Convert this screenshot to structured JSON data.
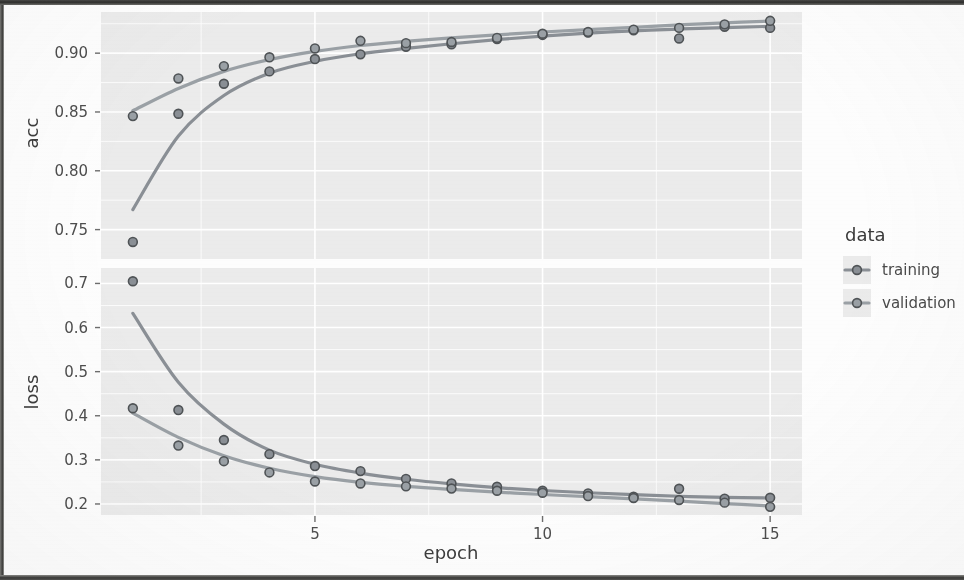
{
  "figure": {
    "background_color": "#fdfdfd",
    "panel_fill": "#ebebeb",
    "grid_color": "#ffffff",
    "training_color": "#8a8f95",
    "validation_color": "#9aa0a5",
    "point_stroke": "#4f5356"
  },
  "axes": {
    "x_title": "epoch",
    "x_ticks": [
      "5",
      "10",
      "15"
    ],
    "x_tick_values": [
      5,
      10,
      15
    ],
    "x_range": [
      0.3,
      15.7
    ],
    "panels": [
      {
        "name": "acc",
        "y_title": "acc",
        "y_ticks": [
          "0.90",
          "0.85",
          "0.80",
          "0.75"
        ],
        "y_tick_values": [
          0.9,
          0.85,
          0.8,
          0.75
        ],
        "y_range": [
          0.725,
          0.935
        ]
      },
      {
        "name": "loss",
        "y_title": "loss",
        "y_ticks": [
          "0.7",
          "0.6",
          "0.5",
          "0.4",
          "0.3",
          "0.2"
        ],
        "y_tick_values": [
          0.7,
          0.6,
          0.5,
          0.4,
          0.3,
          0.2
        ],
        "y_range": [
          0.175,
          0.735
        ]
      }
    ]
  },
  "legend": {
    "title": "data",
    "items": [
      {
        "label": "training",
        "color": "#8a8f95"
      },
      {
        "label": "validation",
        "color": "#9aa0a5"
      }
    ]
  },
  "chart_data": {
    "type": "line",
    "title": "",
    "subtitle": "",
    "xlabel": "epoch",
    "x": [
      1,
      2,
      3,
      4,
      5,
      6,
      7,
      8,
      9,
      10,
      11,
      12,
      13,
      14,
      15
    ],
    "grid": true,
    "legend_position": "right",
    "facets": [
      {
        "name": "acc",
        "ylabel": "acc",
        "ylim": [
          0.725,
          0.935
        ],
        "yticks": [
          0.75,
          0.8,
          0.85,
          0.9
        ],
        "series": [
          {
            "name": "training",
            "color": "#8a8f95",
            "values": [
              0.7395,
              0.8485,
              0.874,
              0.8845,
              0.895,
              0.899,
              0.9055,
              0.9075,
              0.912,
              0.9155,
              0.9175,
              0.9195,
              0.9125,
              0.9225,
              0.9215
            ],
            "smooth": [
              0.767,
              0.8295,
              0.864,
              0.883,
              0.893,
              0.8995,
              0.904,
              0.908,
              0.9115,
              0.9145,
              0.917,
              0.919,
              0.9205,
              0.9218,
              0.9228
            ]
          },
          {
            "name": "validation",
            "color": "#9aa0a5",
            "values": [
              0.8465,
              0.8785,
              0.889,
              0.8965,
              0.904,
              0.9105,
              0.9085,
              0.9095,
              0.913,
              0.9165,
              0.918,
              0.92,
              0.9215,
              0.9245,
              0.9275
            ],
            "smooth": [
              0.851,
              0.87,
              0.8845,
              0.8945,
              0.9015,
              0.9065,
              0.91,
              0.913,
              0.9155,
              0.918,
              0.92,
              0.922,
              0.924,
              0.9258,
              0.9272
            ]
          }
        ]
      },
      {
        "name": "loss",
        "ylabel": "loss",
        "ylim": [
          0.175,
          0.735
        ],
        "yticks": [
          0.2,
          0.3,
          0.4,
          0.5,
          0.6,
          0.7
        ],
        "series": [
          {
            "name": "training",
            "color": "#8a8f95",
            "values": [
              0.705,
              0.413,
              0.345,
              0.313,
              0.286,
              0.2745,
              0.257,
              0.2465,
              0.239,
              0.23,
              0.224,
              0.2165,
              0.2345,
              0.212,
              0.214
            ],
            "smooth": [
              0.632,
              0.476,
              0.381,
              0.322,
              0.29,
              0.27,
              0.256,
              0.2455,
              0.237,
              0.2305,
              0.2255,
              0.221,
              0.2175,
              0.215,
              0.2135
            ]
          },
          {
            "name": "validation",
            "color": "#9aa0a5",
            "values": [
              0.417,
              0.3325,
              0.297,
              0.2715,
              0.251,
              0.2465,
              0.24,
              0.235,
              0.23,
              0.2255,
              0.218,
              0.2135,
              0.209,
              0.203,
              0.1935
            ],
            "smooth": [
              0.406,
              0.351,
              0.3095,
              0.281,
              0.262,
              0.249,
              0.24,
              0.233,
              0.227,
              0.2215,
              0.2165,
              0.2115,
              0.2065,
              0.201,
              0.1955
            ]
          }
        ]
      }
    ]
  }
}
